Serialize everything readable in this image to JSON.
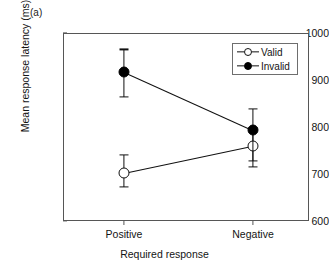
{
  "panel": {
    "label": "(a)"
  },
  "chart_data": {
    "type": "line",
    "title": "",
    "xlabel": "Required response",
    "ylabel": "Mean response latency (ms)",
    "categories": [
      "Positive",
      "Negative"
    ],
    "ylim": [
      600,
      1000
    ],
    "yticks": [
      600,
      700,
      800,
      900,
      1000
    ],
    "ytick_labels": [
      "600",
      "700",
      "800",
      "900",
      "1000"
    ],
    "grid": false,
    "legend_position": "top-right",
    "series": [
      {
        "name": "Valid",
        "marker": "open-circle",
        "color": "#000000",
        "values": [
          702,
          760
        ],
        "err_low": [
          672,
          727
        ],
        "err_high": [
          740,
          798
        ]
      },
      {
        "name": "Invalid",
        "marker": "filled-circle",
        "color": "#000000",
        "values": [
          918,
          794
        ],
        "err_low": [
          864,
          715
        ],
        "err_high": [
          965,
          838
        ]
      }
    ]
  },
  "legend": {
    "entries": [
      {
        "label": "Valid"
      },
      {
        "label": "Invalid"
      }
    ]
  },
  "axis": {
    "ytick_0": "600",
    "ytick_1": "700",
    "ytick_2": "800",
    "ytick_3": "900",
    "ytick_4": "1000",
    "xtick_0": "Positive",
    "xtick_1": "Negative"
  }
}
